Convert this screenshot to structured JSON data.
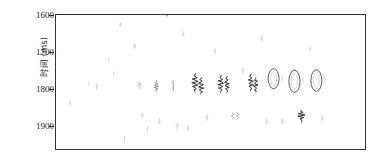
{
  "chart_data": {
    "type": "line",
    "title": "",
    "xlabel": "",
    "ylabel": "时间 (ms)",
    "ylim": [
      1600,
      1960
    ],
    "xlim": [
      0,
      311
    ],
    "grid": false,
    "legend": null,
    "y_ticks": [
      1600,
      1700,
      1800,
      1900
    ],
    "y_tick_labels": [
      "1600",
      "1700",
      "1800",
      "1900"
    ],
    "x_ticks": [],
    "x_tick_labels": [],
    "axis_color": "#333333",
    "trace_color": "#2b2b2b",
    "series": [
      {
        "name": "trace-01",
        "x": 14,
        "t_center": 1836,
        "t_span": 14,
        "amp": 0.18,
        "style": "faint-spike"
      },
      {
        "name": "trace-02",
        "x": 33,
        "t_center": 1783,
        "t_span": 10,
        "amp": 0.14,
        "style": "faint-spike"
      },
      {
        "name": "trace-03",
        "x": 41,
        "t_center": 1792,
        "t_span": 16,
        "amp": 0.22,
        "style": "faint-spike"
      },
      {
        "name": "trace-04",
        "x": 53,
        "t_center": 1718,
        "t_span": 12,
        "amp": 0.16,
        "style": "faint-spike"
      },
      {
        "name": "trace-05",
        "x": 58,
        "t_center": 1757,
        "t_span": 12,
        "amp": 0.18,
        "style": "faint-spike"
      },
      {
        "name": "trace-06",
        "x": 65,
        "t_center": 1625,
        "t_span": 14,
        "amp": 0.2,
        "style": "faint-spike"
      },
      {
        "name": "trace-07",
        "x": 69,
        "t_center": 1930,
        "t_span": 12,
        "amp": 0.15,
        "style": "faint-spike"
      },
      {
        "name": "trace-08",
        "x": 79,
        "t_center": 1683,
        "t_span": 16,
        "amp": 0.24,
        "style": "faint-spike"
      },
      {
        "name": "trace-09",
        "x": 84,
        "t_center": 1789,
        "t_span": 18,
        "amp": 0.3,
        "style": "spike"
      },
      {
        "name": "trace-10",
        "x": 87,
        "t_center": 1869,
        "t_span": 16,
        "amp": 0.22,
        "style": "faint-spike"
      },
      {
        "name": "trace-11",
        "x": 92,
        "t_center": 1906,
        "t_span": 14,
        "amp": 0.18,
        "style": "faint-spike"
      },
      {
        "name": "trace-12",
        "x": 101,
        "t_center": 1790,
        "t_span": 30,
        "amp": 0.45,
        "style": "wiggle"
      },
      {
        "name": "trace-13",
        "x": 104,
        "t_center": 1885,
        "t_span": 16,
        "amp": 0.22,
        "style": "faint-spike"
      },
      {
        "name": "trace-14",
        "x": 112,
        "t_center": 1600,
        "t_span": 8,
        "amp": 0.3,
        "style": "spike"
      },
      {
        "name": "trace-15",
        "x": 118,
        "t_center": 1790,
        "t_span": 28,
        "amp": 0.4,
        "style": "wiggle"
      },
      {
        "name": "trace-16",
        "x": 122,
        "t_center": 1897,
        "t_span": 18,
        "amp": 0.25,
        "style": "faint-spike"
      },
      {
        "name": "trace-17",
        "x": 128,
        "t_center": 1651,
        "t_span": 14,
        "amp": 0.22,
        "style": "faint-spike"
      },
      {
        "name": "trace-18",
        "x": 133,
        "t_center": 1904,
        "t_span": 16,
        "amp": 0.22,
        "style": "faint-spike"
      },
      {
        "name": "trace-19",
        "x": 140,
        "t_center": 1782,
        "t_span": 52,
        "amp": 0.8,
        "style": "wiggle-strong"
      },
      {
        "name": "trace-20",
        "x": 146,
        "t_center": 1790,
        "t_span": 46,
        "amp": 0.7,
        "style": "wiggle-strong"
      },
      {
        "name": "trace-21",
        "x": 152,
        "t_center": 1876,
        "t_span": 18,
        "amp": 0.26,
        "style": "faint-spike"
      },
      {
        "name": "trace-22",
        "x": 160,
        "t_center": 1696,
        "t_span": 16,
        "amp": 0.22,
        "style": "faint-spike"
      },
      {
        "name": "trace-23",
        "x": 166,
        "t_center": 1785,
        "t_span": 48,
        "amp": 0.72,
        "style": "wiggle-strong"
      },
      {
        "name": "trace-24",
        "x": 172,
        "t_center": 1786,
        "t_span": 44,
        "amp": 0.62,
        "style": "wiggle-strong"
      },
      {
        "name": "trace-25",
        "x": 178,
        "t_center": 1871,
        "t_span": 20,
        "amp": 0.3,
        "style": "spike"
      },
      {
        "name": "trace-26",
        "x": 183,
        "t_center": 1871,
        "t_span": 20,
        "amp": 0.28,
        "style": "spike"
      },
      {
        "name": "trace-27",
        "x": 188,
        "t_center": 1749,
        "t_span": 18,
        "amp": 0.26,
        "style": "faint-spike"
      },
      {
        "name": "trace-28",
        "x": 196,
        "t_center": 1781,
        "t_span": 46,
        "amp": 0.7,
        "style": "wiggle-strong"
      },
      {
        "name": "trace-29",
        "x": 201,
        "t_center": 1788,
        "t_span": 40,
        "amp": 0.58,
        "style": "wiggle-strong"
      },
      {
        "name": "trace-30",
        "x": 207,
        "t_center": 1662,
        "t_span": 18,
        "amp": 0.26,
        "style": "faint-spike"
      },
      {
        "name": "trace-31",
        "x": 212,
        "t_center": 1886,
        "t_span": 16,
        "amp": 0.22,
        "style": "faint-spike"
      },
      {
        "name": "trace-32",
        "x": 219,
        "t_center": 1771,
        "t_span": 54,
        "amp": 0.95,
        "style": "ring"
      },
      {
        "name": "trace-33",
        "x": 228,
        "t_center": 1885,
        "t_span": 16,
        "amp": 0.22,
        "style": "faint-spike"
      },
      {
        "name": "trace-34",
        "x": 240,
        "t_center": 1778,
        "t_span": 60,
        "amp": 1.0,
        "style": "ring"
      },
      {
        "name": "trace-35",
        "x": 247,
        "t_center": 1872,
        "t_span": 34,
        "amp": 0.85,
        "style": "wiggle-strong"
      },
      {
        "name": "trace-36",
        "x": 256,
        "t_center": 1690,
        "t_span": 14,
        "amp": 0.18,
        "style": "faint-spike"
      },
      {
        "name": "trace-37",
        "x": 262,
        "t_center": 1776,
        "t_span": 58,
        "amp": 0.95,
        "style": "ring"
      },
      {
        "name": "trace-38",
        "x": 268,
        "t_center": 1877,
        "t_span": 16,
        "amp": 0.2,
        "style": "faint-spike"
      }
    ]
  }
}
